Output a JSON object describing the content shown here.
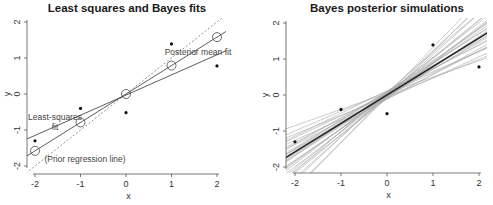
{
  "chart_data": [
    {
      "type": "scatter",
      "title": "Least squares and Bayes fits",
      "xlabel": "x",
      "ylabel": "y",
      "xlim": [
        -2.2,
        2.2
      ],
      "ylim": [
        -2.1,
        2.2
      ],
      "xticks": [
        -2,
        -1,
        0,
        1,
        2
      ],
      "yticks": [
        -2,
        -1,
        0,
        1,
        2
      ],
      "grid": false,
      "points": {
        "x": [
          -2,
          -1,
          0,
          1,
          2
        ],
        "y": [
          -1.3,
          -0.4,
          -0.52,
          1.39,
          0.78
        ]
      },
      "lines": [
        {
          "name": "Least-squares fit",
          "intercept": -0.03,
          "slope": 0.56,
          "style": "solid"
        },
        {
          "name": "Posterior mean fit",
          "intercept": 0.0,
          "slope": 0.79,
          "style": "solid",
          "markers": "open-circle",
          "marker_x": [
            -2,
            -1,
            0,
            1,
            2
          ],
          "marker_y": [
            -1.58,
            -0.79,
            0.0,
            0.79,
            1.58
          ]
        },
        {
          "name": "(Prior regression line)",
          "intercept": 0.0,
          "slope": 1.0,
          "style": "dashed"
        }
      ],
      "annotations": [
        "Least-squares",
        "fit",
        "Posterior mean fit",
        "(Prior regression line)"
      ]
    },
    {
      "type": "line",
      "title": "Bayes posterior simulations",
      "xlabel": "x",
      "ylabel": "y",
      "xlim": [
        -2.2,
        2.2
      ],
      "ylim": [
        -2.1,
        2.2
      ],
      "xticks": [
        -2,
        -1,
        0,
        1,
        2
      ],
      "yticks": [
        -2,
        -1,
        0,
        1,
        2
      ],
      "grid": false,
      "points": {
        "x": [
          -2,
          -1,
          0,
          1,
          2
        ],
        "y": [
          -1.3,
          -0.4,
          -0.52,
          1.39,
          0.78
        ]
      },
      "mean_line": {
        "intercept": 0.0,
        "slope": 0.79
      },
      "simulations": [
        {
          "intercept": 0.05,
          "slope": 0.45
        },
        {
          "intercept": -0.05,
          "slope": 0.52
        },
        {
          "intercept": 0.1,
          "slope": 0.55
        },
        {
          "intercept": -0.1,
          "slope": 0.58
        },
        {
          "intercept": 0.02,
          "slope": 0.6
        },
        {
          "intercept": 0.12,
          "slope": 0.63
        },
        {
          "intercept": -0.08,
          "slope": 0.65
        },
        {
          "intercept": 0.04,
          "slope": 0.68
        },
        {
          "intercept": -0.12,
          "slope": 0.7
        },
        {
          "intercept": 0.08,
          "slope": 0.72
        },
        {
          "intercept": -0.02,
          "slope": 0.74
        },
        {
          "intercept": 0.06,
          "slope": 0.76
        },
        {
          "intercept": -0.06,
          "slope": 0.78
        },
        {
          "intercept": 0.1,
          "slope": 0.8
        },
        {
          "intercept": -0.04,
          "slope": 0.82
        },
        {
          "intercept": 0.03,
          "slope": 0.84
        },
        {
          "intercept": -0.09,
          "slope": 0.86
        },
        {
          "intercept": 0.07,
          "slope": 0.88
        },
        {
          "intercept": -0.03,
          "slope": 0.9
        },
        {
          "intercept": 0.0,
          "slope": 0.93
        },
        {
          "intercept": -0.07,
          "slope": 0.96
        },
        {
          "intercept": 0.05,
          "slope": 0.98
        },
        {
          "intercept": -0.1,
          "slope": 1.0
        },
        {
          "intercept": 0.02,
          "slope": 1.03
        },
        {
          "intercept": -0.05,
          "slope": 1.06
        },
        {
          "intercept": 0.08,
          "slope": 1.1
        },
        {
          "intercept": -0.02,
          "slope": 1.14
        },
        {
          "intercept": 0.03,
          "slope": 1.2
        },
        {
          "intercept": -0.06,
          "slope": 1.26
        },
        {
          "intercept": 0.0,
          "slope": 1.32
        }
      ]
    }
  ]
}
